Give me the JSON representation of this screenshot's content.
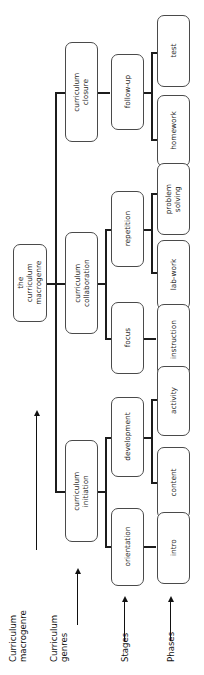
{
  "figure": {
    "orientation": "rotated-90-ccw",
    "type": "hierarchy-tree",
    "line_color": "#1c1c1c",
    "node_border_color": "#4a4a4a",
    "node_fill": "#ffffff"
  },
  "axes": [
    {
      "label": "Curriculum\nmacrogenre",
      "has_arrow": true
    },
    {
      "label": "Curriculum\ngenres",
      "has_arrow": true
    },
    {
      "label": "Stages",
      "has_arrow": true
    },
    {
      "label": "Phases",
      "has_arrow": true
    }
  ],
  "root": {
    "label": "the curriculum\nmacrogenre"
  },
  "genres": [
    {
      "label": "curriculum\nclosure"
    },
    {
      "label": "curriculum\ncollaboration"
    },
    {
      "label": "curriculum\ninitiation"
    }
  ],
  "stages": [
    {
      "label": "follow-up"
    },
    {
      "label": "repetition"
    },
    {
      "label": "focus"
    },
    {
      "label": "development"
    },
    {
      "label": "orientation"
    }
  ],
  "phases": [
    {
      "label": "test"
    },
    {
      "label": "homework"
    },
    {
      "label": "problem\nsolving"
    },
    {
      "label": "lab-work"
    },
    {
      "label": "instruction"
    },
    {
      "label": "activity"
    },
    {
      "label": "content"
    },
    {
      "label": "intro"
    }
  ]
}
